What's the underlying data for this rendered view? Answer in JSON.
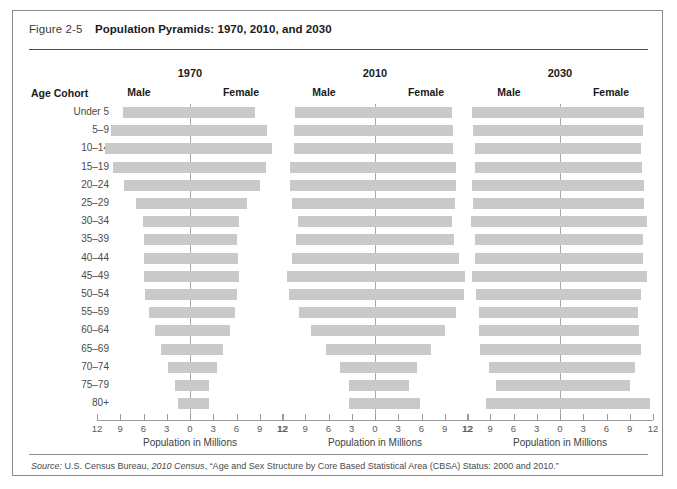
{
  "figure": {
    "number": "Figure 2-5",
    "title": "Population Pyramids: 1970, 2010, and 2030",
    "age_cohort_header": "Age Cohort",
    "axis_title": "Population in Millions",
    "source_prefix": "Source:",
    "source_text_1": " U.S. Census Bureau, ",
    "source_italic": "2010 Census",
    "source_text_2": ", “Age and Sex Structure by Core Based Statistical Area (CBSA) Status: 2000 and 2010.”"
  },
  "labels": {
    "male": "Male",
    "female": "Female"
  },
  "colors": {
    "bar_fill": "#c9c9c9",
    "axis_line": "#a9a9a9",
    "frame_border": "#8c8c8c",
    "text": "#231f20"
  },
  "chart_data": {
    "type": "bar",
    "subtype": "population-pyramid",
    "title": "Population Pyramids: 1970, 2010, and 2030",
    "xlabel": "Population in Millions",
    "ylabel": "Age Cohort",
    "xlim": [
      -12,
      12
    ],
    "xticks": [
      -12,
      -9,
      -6,
      -3,
      0,
      3,
      6,
      9,
      12
    ],
    "xticklabels": [
      "12",
      "9",
      "6",
      "3",
      "0",
      "3",
      "6",
      "9",
      "12"
    ],
    "grid": false,
    "legend": "none",
    "categories": [
      "Under 5",
      "5–9",
      "10–14",
      "15–19",
      "20–24",
      "25–29",
      "30–34",
      "35–39",
      "40–44",
      "45–49",
      "50–54",
      "55–59",
      "60–64",
      "65–69",
      "70–74",
      "75–79",
      "80+"
    ],
    "panels": [
      {
        "year": "1970",
        "series": [
          {
            "name": "Male",
            "values": [
              8.7,
              10.2,
              11.0,
              10.0,
              8.5,
              7.0,
              6.1,
              5.9,
              5.9,
              6.0,
              5.8,
              5.3,
              4.5,
              3.7,
              2.9,
              1.9,
              1.5
            ]
          },
          {
            "name": "Female",
            "values": [
              8.4,
              9.9,
              10.6,
              9.8,
              9.0,
              7.3,
              6.3,
              6.0,
              6.2,
              6.3,
              6.1,
              5.8,
              5.1,
              4.3,
              3.5,
              2.5,
              2.4
            ]
          }
        ]
      },
      {
        "year": "2010",
        "series": [
          {
            "name": "Male",
            "values": [
              10.3,
              10.4,
              10.5,
              11.0,
              11.0,
              10.7,
              10.0,
              10.2,
              10.7,
              11.4,
              11.1,
              9.8,
              8.3,
              6.3,
              4.5,
              3.4,
              3.4
            ]
          },
          {
            "name": "Female",
            "values": [
              9.9,
              10.0,
              10.1,
              10.5,
              10.5,
              10.3,
              9.9,
              10.2,
              10.8,
              11.6,
              11.5,
              10.4,
              9.0,
              7.2,
              5.4,
              4.4,
              5.8
            ]
          }
        ]
      },
      {
        "year": "2030",
        "series": [
          {
            "name": "Male",
            "values": [
              11.4,
              11.2,
              11.0,
              11.0,
              11.3,
              11.2,
              11.5,
              11.0,
              11.0,
              11.4,
              10.8,
              10.4,
              10.4,
              10.3,
              9.2,
              8.3,
              9.6
            ]
          },
          {
            "name": "Female",
            "values": [
              10.9,
              10.7,
              10.5,
              10.6,
              10.8,
              10.8,
              11.2,
              10.7,
              10.7,
              11.2,
              10.5,
              10.1,
              10.2,
              10.4,
              9.7,
              9.0,
              11.6
            ]
          }
        ]
      }
    ]
  }
}
